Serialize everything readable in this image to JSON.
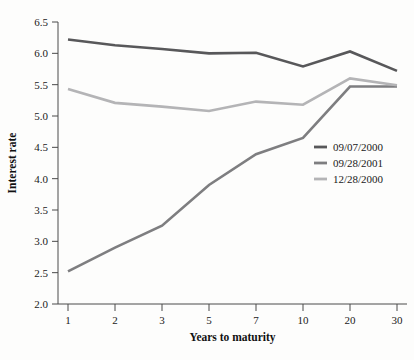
{
  "chart_data": {
    "type": "line",
    "title": "",
    "xlabel": "Years to maturity",
    "ylabel": "Interest rate",
    "categories": [
      "1",
      "2",
      "3",
      "5",
      "7",
      "10",
      "20",
      "30"
    ],
    "ylim": [
      2.0,
      6.5
    ],
    "yticks": [
      "2.0",
      "2.5",
      "3.0",
      "3.5",
      "4.0",
      "4.5",
      "5.0",
      "5.5",
      "6.0",
      "6.5"
    ],
    "grid": false,
    "legend_position": "center-right",
    "series": [
      {
        "name": "09/07/2000",
        "color": "#58585a",
        "values": [
          6.22,
          6.13,
          6.07,
          6.0,
          6.01,
          5.79,
          6.03,
          5.72
        ]
      },
      {
        "name": "09/28/2001",
        "color": "#7e7e80",
        "values": [
          2.52,
          2.9,
          3.25,
          3.9,
          4.39,
          4.65,
          5.47,
          5.47
        ]
      },
      {
        "name": "12/28/2000",
        "color": "#b4b4b6",
        "values": [
          5.43,
          5.21,
          5.15,
          5.08,
          5.23,
          5.18,
          5.6,
          5.49
        ]
      }
    ]
  },
  "axes": {
    "y_axis_label": "Interest rate",
    "x_axis_label": "Years to maturity"
  }
}
